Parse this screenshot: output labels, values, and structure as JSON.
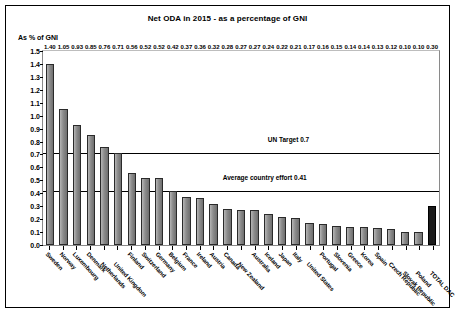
{
  "chart_data": {
    "type": "bar",
    "title": "Net ODA in 2015 - as a percentage of GNI",
    "ylabel": "As % of GNI",
    "xlabel": "",
    "ylim": [
      0.0,
      1.5
    ],
    "ytick_step": 0.1,
    "grid": false,
    "legend": "none",
    "yticks": [
      "1.5",
      "1.4",
      "1.3",
      "1.2",
      "1.1",
      "1.0",
      "0.9",
      "0.8",
      "0.7",
      "0.6",
      "0.5",
      "0.4",
      "0.3",
      "0.2",
      "0.1",
      "0.0"
    ],
    "categories": [
      "Sweden",
      "Norway",
      "Luxembourg",
      "Denmark",
      "Netherlands",
      "United Kingdom",
      "Finland",
      "Switzerland",
      "Germany",
      "Belgium",
      "France",
      "Ireland",
      "Austria",
      "Canada",
      "New Zealand",
      "Australia",
      "Iceland",
      "Japan",
      "Italy",
      "United States",
      "Portugal",
      "Slovenia",
      "Greece",
      "Korea",
      "Spain",
      "Czech Republic",
      "Slovak Republic",
      "Poland",
      "TOTAL DAC"
    ],
    "values": [
      1.4,
      1.05,
      0.93,
      0.85,
      0.76,
      0.71,
      0.56,
      0.52,
      0.52,
      0.42,
      0.37,
      0.36,
      0.32,
      0.28,
      0.27,
      0.27,
      0.24,
      0.22,
      0.21,
      0.17,
      0.16,
      0.15,
      0.14,
      0.14,
      0.13,
      0.12,
      0.1,
      0.1,
      0.3
    ],
    "value_labels": [
      "1.40",
      "1.05",
      "0.93",
      "0.85",
      "0.76",
      "0.71",
      "0.56",
      "0.52",
      "0.52",
      "0.42",
      "0.37",
      "0.36",
      "0.32",
      "0.28",
      "0.27",
      "0.27",
      "0.24",
      "0.22",
      "0.21",
      "0.17",
      "0.16",
      "0.15",
      "0.14",
      "0.14",
      "0.13",
      "0.12",
      "0.10",
      "0.10",
      "0.30"
    ],
    "highlight_index": 28,
    "annotations": [
      {
        "label": "UN Target 0.7",
        "value": 0.7
      },
      {
        "label": "Average country effort 0.41",
        "value": 0.41
      }
    ],
    "colors": {
      "bar": "#8f8f8f",
      "bar_highlight": "#1b1b1b",
      "reference_line": "#000000"
    }
  }
}
